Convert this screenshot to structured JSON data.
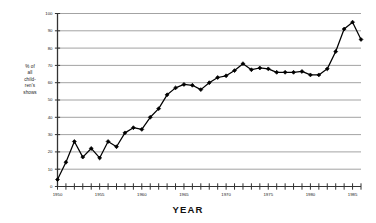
{
  "chart_data": {
    "type": "line",
    "title": "",
    "xlabel": "YEAR",
    "ylabel": "% of all children's shows",
    "ylabel_lines": [
      "% of",
      "all",
      "child-",
      "ren's",
      "shows"
    ],
    "xlim": [
      1950,
      1986
    ],
    "ylim": [
      0,
      100
    ],
    "grid": true,
    "legend": "none",
    "ytick_labels": [
      "0",
      "10",
      "20",
      "30",
      "40",
      "50",
      "60",
      "70",
      "80",
      "90",
      "100"
    ],
    "ytick_values": [
      0,
      10,
      20,
      30,
      40,
      50,
      60,
      70,
      80,
      90,
      100
    ],
    "xtick_labels": [
      "1950",
      "1955",
      "1960",
      "1965",
      "1970",
      "1975",
      "1980",
      "1985"
    ],
    "xtick_values": [
      1950,
      1955,
      1960,
      1965,
      1970,
      1975,
      1980,
      1985
    ],
    "x_minor_step": 1,
    "marker": "filled-diamond",
    "line_color": "#000000",
    "grid_color": "#999999",
    "series": [
      {
        "name": "% of all children's shows",
        "x": [
          1950,
          1951,
          1952,
          1953,
          1954,
          1955,
          1956,
          1957,
          1958,
          1959,
          1960,
          1961,
          1962,
          1963,
          1964,
          1965,
          1966,
          1967,
          1968,
          1969,
          1970,
          1971,
          1972,
          1973,
          1974,
          1975,
          1976,
          1977,
          1978,
          1979,
          1980,
          1981,
          1982,
          1983,
          1984,
          1985
        ],
        "values": [
          4,
          14,
          26,
          17,
          22,
          16.5,
          26,
          23,
          31,
          34,
          33,
          40,
          45,
          53,
          57,
          59,
          58.5,
          56,
          60,
          63,
          64,
          67,
          71,
          67.5,
          68.5,
          68,
          66,
          66,
          66,
          66.5,
          64.5,
          64.5,
          68,
          78,
          91,
          95
        ],
        "last_value": 85
      }
    ]
  }
}
